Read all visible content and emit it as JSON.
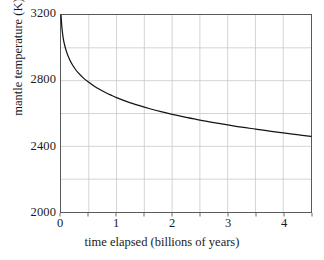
{
  "chart_data": {
    "type": "line",
    "title": "",
    "xlabel": "time elapsed (billions of years)",
    "ylabel": "mantle temperature (K)",
    "xlim": [
      0,
      4.5
    ],
    "ylim": [
      2000,
      3200
    ],
    "xticks": [
      0,
      0.5,
      1,
      1.5,
      2,
      2.5,
      3,
      3.5,
      4,
      4.5
    ],
    "xtick_labels": [
      "0",
      "",
      "1",
      "",
      "2",
      "",
      "3",
      "",
      "4",
      ""
    ],
    "yticks": [
      2000,
      2200,
      2400,
      2600,
      2800,
      3000,
      3200
    ],
    "ytick_labels": [
      "2000",
      "",
      "2400",
      "",
      "2800",
      "",
      "3200"
    ],
    "grid": true,
    "grid_color": "#c8c8c8",
    "legend": null,
    "series": [
      {
        "name": "mantle temperature",
        "color": "#141414",
        "x": [
          0,
          0.02,
          0.05,
          0.1,
          0.15,
          0.2,
          0.25,
          0.3,
          0.4,
          0.5,
          0.6,
          0.7,
          0.8,
          0.9,
          1.0,
          1.2,
          1.4,
          1.6,
          1.8,
          2.0,
          2.25,
          2.5,
          2.75,
          3.0,
          3.25,
          3.5,
          3.75,
          4.0,
          4.25,
          4.5
        ],
        "y": [
          3200,
          3110,
          3040,
          2975,
          2932,
          2900,
          2874,
          2852,
          2817,
          2790,
          2766,
          2746,
          2728,
          2712,
          2697,
          2671,
          2649,
          2629,
          2611,
          2595,
          2577,
          2560,
          2545,
          2531,
          2517,
          2505,
          2493,
          2482,
          2471,
          2461
        ]
      }
    ]
  },
  "axes": {
    "ytick_entries": [
      {
        "label": "3200",
        "value": 3200
      },
      {
        "label": "2800",
        "value": 2800
      },
      {
        "label": "2400",
        "value": 2400
      },
      {
        "label": "2000",
        "value": 2000
      }
    ],
    "xtick_entries": [
      {
        "label": "0",
        "value": 0
      },
      {
        "label": "1",
        "value": 1
      },
      {
        "label": "2",
        "value": 2
      },
      {
        "label": "3",
        "value": 3
      },
      {
        "label": "4",
        "value": 4
      }
    ]
  }
}
